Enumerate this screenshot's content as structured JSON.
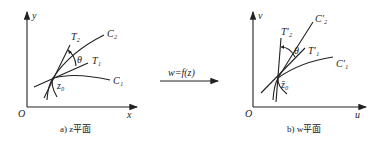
{
  "diagram": {
    "left_panel": {
      "caption": "a) z平面",
      "axis_x_label": "x",
      "axis_y_label": "y",
      "origin_label": "O",
      "point_label": "z₀",
      "curves": [
        {
          "label": "C₁"
        },
        {
          "label": "C₂"
        }
      ],
      "tangents": [
        {
          "label": "T₁"
        },
        {
          "label": "T₂"
        }
      ],
      "angle_label": "θ"
    },
    "mapping": {
      "label": "w=f(z)"
    },
    "right_panel": {
      "caption": "b) w平面",
      "axis_x_label": "u",
      "axis_y_label": "v",
      "origin_label": "O",
      "point_label": "z̄₀",
      "curves": [
        {
          "label": "C′₁"
        },
        {
          "label": "C′₂"
        }
      ],
      "tangents": [
        {
          "label": "T′₁"
        },
        {
          "label": "T′₂"
        }
      ],
      "angle_label": "θ"
    }
  }
}
